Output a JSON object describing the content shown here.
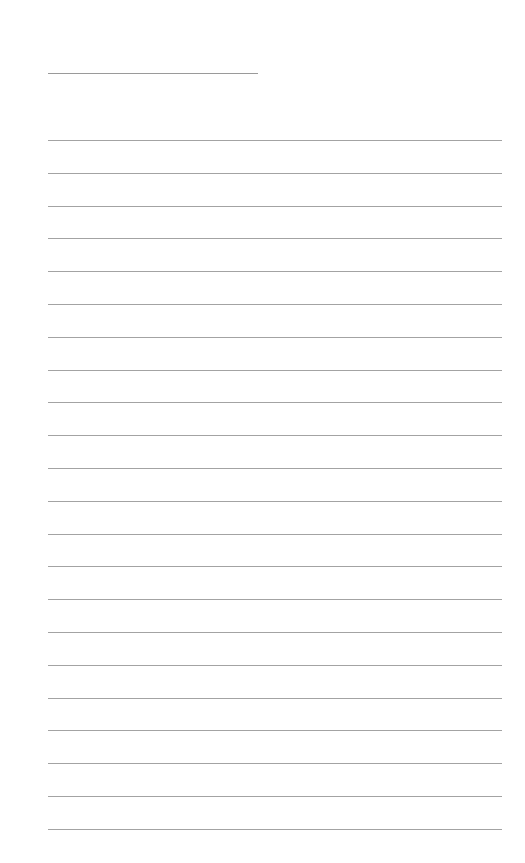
{
  "page": {
    "type": "lined-paper",
    "title_line": {
      "x": 48,
      "y": 73,
      "width": 210
    },
    "rules": {
      "count": 22,
      "x": 48,
      "width": 454,
      "first_y": 140,
      "spacing": 32.8
    },
    "colors": {
      "background": "#ffffff",
      "line": "#a3a3a3"
    }
  }
}
